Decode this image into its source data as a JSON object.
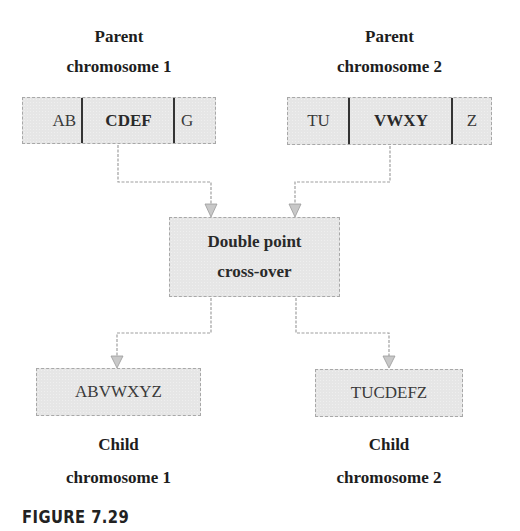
{
  "parents": [
    {
      "title_line1": "Parent",
      "title_line2": "chromosome 1",
      "segments": [
        {
          "text": "AB",
          "bold": false
        },
        {
          "text": "CDEF",
          "bold": true
        },
        {
          "text": "G",
          "bold": false
        }
      ]
    },
    {
      "title_line1": "Parent",
      "title_line2": "chromosome 2",
      "segments": [
        {
          "text": "TU",
          "bold": false
        },
        {
          "text": "VWXY",
          "bold": true
        },
        {
          "text": "Z",
          "bold": false
        }
      ]
    }
  ],
  "operation": {
    "line1": "Double point",
    "line2": "cross-over"
  },
  "children": [
    {
      "sequence": "ABVWXYZ",
      "title_line1": "Child",
      "title_line2": "chromosome 1"
    },
    {
      "sequence": "TUCDEFZ",
      "title_line1": "Child",
      "title_line2": "chromosome 2"
    }
  ],
  "caption": "FIGURE 7.29",
  "colors": {
    "box_fill": "#e6e6e6",
    "box_border": "#a8a8a8",
    "connector": "#a0a0a0",
    "divider": "#333333"
  }
}
